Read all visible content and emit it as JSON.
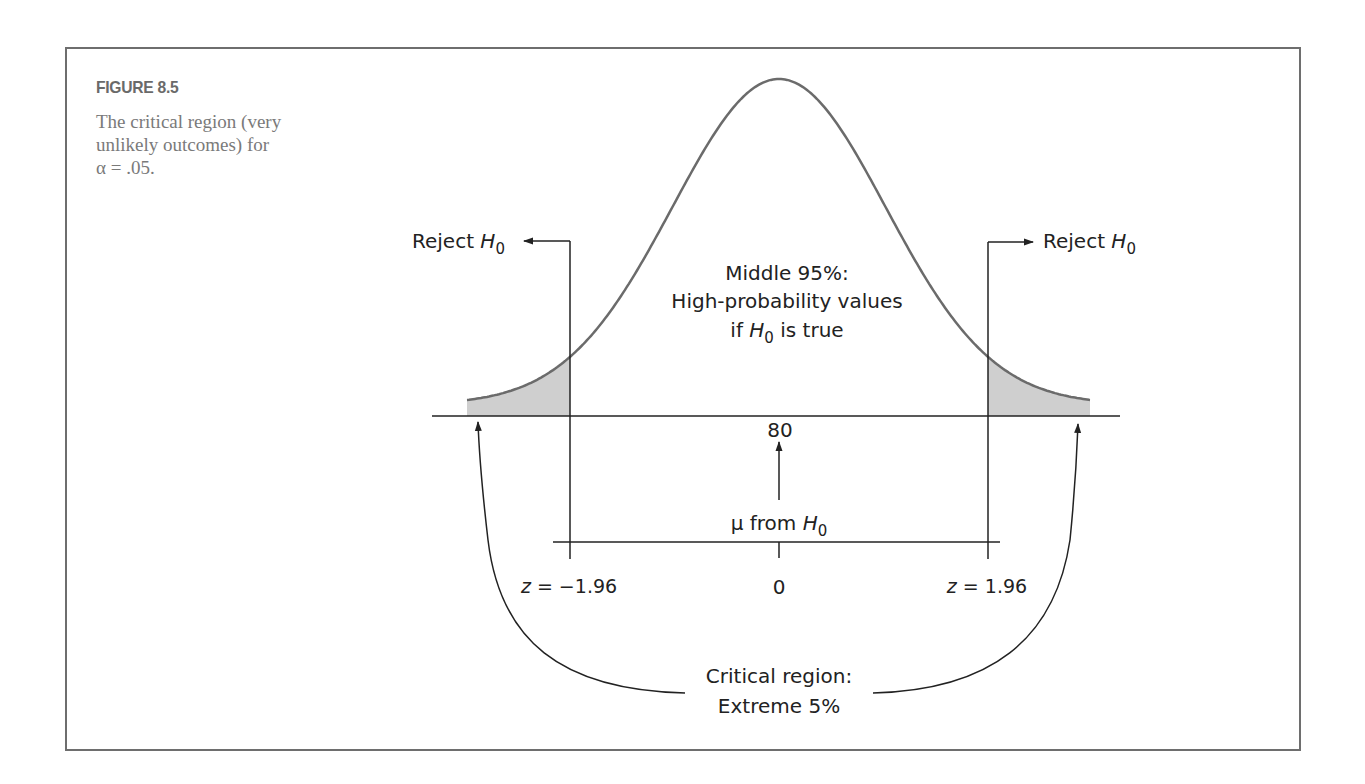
{
  "figure": {
    "label": "FIGURE 8.5",
    "caption_line1": "The critical region (very",
    "caption_line2": "unlikely outcomes) for",
    "caption_line3": "α = .05."
  },
  "diagram": {
    "reject_left": {
      "text": "Reject ",
      "var": "H",
      "sub": "0"
    },
    "reject_right": {
      "text": "Reject ",
      "var": "H",
      "sub": "0"
    },
    "middle": {
      "line1": "Middle 95%:",
      "line2": "High-probability values",
      "line3_pre": "if ",
      "line3_var": "H",
      "line3_sub": "0",
      "line3_post": " is true"
    },
    "mean_value": "80",
    "mu_label": {
      "pre": "μ from ",
      "var": "H",
      "sub": "0"
    },
    "z_left": {
      "var": "z",
      "text": " = −1.96"
    },
    "z_center": "0",
    "z_right": {
      "var": "z",
      "text": " = 1.96"
    },
    "critical": {
      "line1": "Critical region:",
      "line2": "Extreme 5%"
    },
    "colors": {
      "curve": "#6b6b6b",
      "line": "#222222",
      "shade": "#cfcfcf",
      "frame": "#6e6e6e"
    }
  },
  "curve_params": {
    "center_x": 779,
    "sigma_px": 106.6,
    "baseline_y": 404.5,
    "peak_y": 79,
    "x_start": 467,
    "x_end": 1090,
    "axis_y": 416,
    "crit_left_x": 570,
    "crit_right_x": 988
  }
}
